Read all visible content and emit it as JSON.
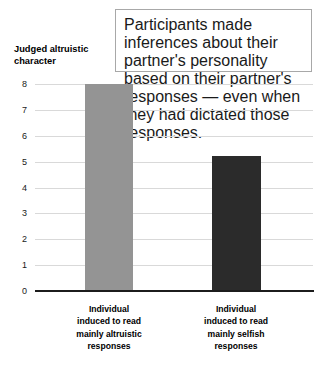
{
  "annotation": {
    "text": "Participants made inferences about their partner's personality based on their partner's responses — even when they had dictated those responses."
  },
  "chart_data": {
    "type": "bar",
    "title": "",
    "xlabel": "",
    "ylabel": "Judged altruistic character",
    "categories": [
      "Individual\ninduced to read\nmainly altruistic\nresponses",
      "Individual\ninduced to read\nmainly selfish\nresponses"
    ],
    "values": [
      8.0,
      5.2
    ],
    "ylim": [
      0,
      8
    ],
    "yticks": [
      "0",
      "1",
      "2",
      "3",
      "4",
      "5",
      "6",
      "7",
      "8"
    ],
    "grid": true,
    "legend": "none",
    "bar_colors": [
      "#949494",
      "#2b2b2b"
    ],
    "gridline_color": "#d9d9d9",
    "axis_color": "#1c1c1c"
  }
}
